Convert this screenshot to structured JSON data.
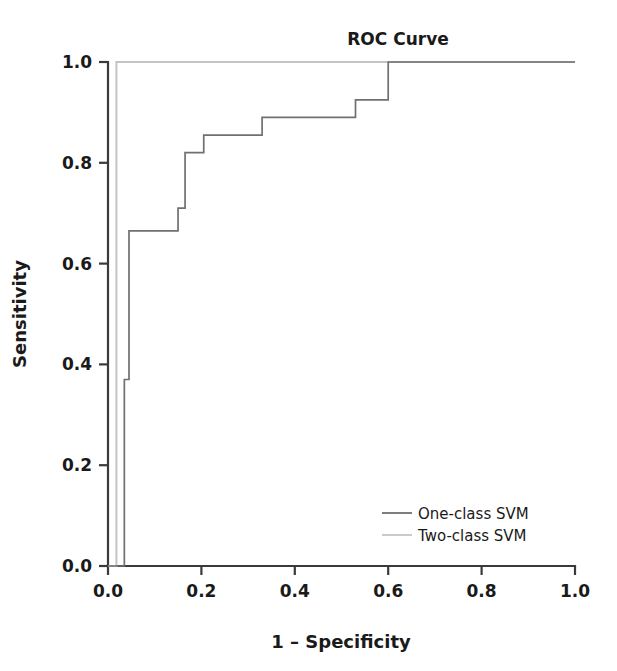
{
  "chart_data": {
    "type": "line",
    "title": "ROC Curve",
    "xlabel": "1 – Specificity",
    "ylabel": "Sensitivity",
    "xlim": [
      0.0,
      1.0
    ],
    "ylim": [
      0.0,
      1.0
    ],
    "grid": false,
    "legend_position": "lower right",
    "xticks": [
      "0.0",
      "0.2",
      "0.4",
      "0.6",
      "0.8",
      "1.0"
    ],
    "xtick_values": [
      0.0,
      0.2,
      0.4,
      0.6,
      0.8,
      1.0
    ],
    "yticks": [
      "0.0",
      "0.2",
      "0.4",
      "0.6",
      "0.8",
      "1.0"
    ],
    "ytick_values": [
      0.0,
      0.2,
      0.4,
      0.6,
      0.8,
      1.0
    ],
    "series": [
      {
        "name": "One-class SVM",
        "color": "#707070",
        "x": [
          0.0,
          0.035,
          0.035,
          0.045,
          0.045,
          0.15,
          0.15,
          0.165,
          0.165,
          0.205,
          0.205,
          0.33,
          0.33,
          0.53,
          0.53,
          0.6,
          0.6,
          1.0
        ],
        "y": [
          0.0,
          0.0,
          0.37,
          0.37,
          0.665,
          0.665,
          0.71,
          0.71,
          0.82,
          0.82,
          0.855,
          0.855,
          0.89,
          0.89,
          0.925,
          0.925,
          1.0,
          1.0
        ]
      },
      {
        "name": "Two-class SVM",
        "color": "#c4c4c4",
        "x": [
          0.0,
          0.0,
          0.018,
          0.018,
          1.0
        ],
        "y": [
          0.0,
          0.0,
          0.0,
          1.0,
          1.0
        ]
      }
    ],
    "legend_entries": [
      {
        "label": "One-class SVM",
        "color": "#707070"
      },
      {
        "label": "Two-class SVM",
        "color": "#c4c4c4"
      }
    ]
  },
  "colors": {
    "axis": "#3a3a3a",
    "text": "#1a1a1a",
    "background": "#ffffff",
    "series_one_class": "#707070",
    "series_two_class": "#c4c4c4"
  }
}
